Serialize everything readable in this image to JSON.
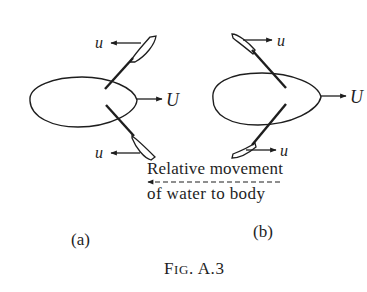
{
  "diagram": {
    "panels": [
      {
        "id": "a",
        "caption": "(a)",
        "body_velocity_label": "U",
        "fin_velocity_labels": [
          "u",
          "u"
        ],
        "fin_arrow_direction": "left"
      },
      {
        "id": "b",
        "caption": "(b)",
        "body_velocity_label": "U",
        "fin_velocity_labels": [
          "u",
          "u"
        ],
        "fin_arrow_direction": "right"
      }
    ],
    "annotation": {
      "line1": "Relative movement",
      "line2": "of water to body",
      "arrow_direction": "left"
    },
    "figure_caption": {
      "prefix_F": "F",
      "prefix_rest": "IG",
      "suffix": ". A.3"
    },
    "colors": {
      "ink": "#1e1e1e",
      "background": "#ffffff"
    }
  }
}
